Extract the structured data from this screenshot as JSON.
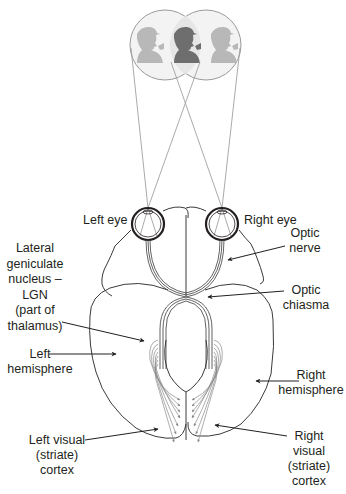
{
  "diagram": {
    "colors": {
      "line": "#3a3a3a",
      "ray": "#9a9a9a",
      "silhouette_side": "#b5b5b5",
      "silhouette_center": "#6e6e6e",
      "field_fill": "#e8e8e8"
    },
    "visual_field": {
      "figures": [
        "left-silhouette",
        "center-silhouette",
        "right-silhouette"
      ]
    },
    "labels": {
      "left_eye": "Left eye",
      "right_eye": "Right eye",
      "optic_nerve": "Optic\nnerve",
      "lgn": "Lateral\ngeniculate\nnucleus –\nLGN\n(part of\nthalamus)",
      "optic_chiasma": "Optic\nchiasma",
      "left_hemisphere": "Left\nhemisphere",
      "right_hemisphere": "Right\nhemisphere",
      "left_visual_cortex": "Left visual\n(striate)\ncortex",
      "right_visual_cortex": "Right\nvisual\n(striate)\ncortex"
    }
  }
}
